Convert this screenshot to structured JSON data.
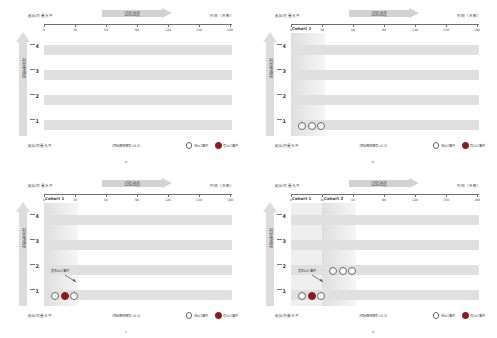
{
  "figure": {
    "panels": [
      {
        "letter": "a",
        "header_left": "起始剂量水平",
        "header_right": "时间（天数）",
        "progress_label": "试验进度",
        "dose_axis_label": "剂量递增",
        "footer_left": "起始剂量水平",
        "footer_center": "（目标毒性概率=0.3）",
        "legend": [
          {
            "marker": "open-circle",
            "label": "无DLT事件"
          },
          {
            "marker": "filled-circle",
            "label": "有DLT事件"
          }
        ],
        "x_ticks": [
          "0",
          "30",
          "60",
          "90",
          "120",
          "150",
          "180"
        ],
        "dose_levels": [
          "1",
          "2",
          "3",
          "4"
        ],
        "cohorts": [],
        "subjects": [],
        "annotation": null
      },
      {
        "letter": "b",
        "header_left": "起始剂量水平",
        "header_right": "时间（天数）",
        "progress_label": "试验进度",
        "dose_axis_label": "剂量递增",
        "footer_left": "起始剂量水平",
        "footer_center": "（目标毒性概率=0.3）",
        "legend": [
          {
            "marker": "open-circle",
            "label": "无DLT事件"
          },
          {
            "marker": "filled-circle",
            "label": "有DLT事件"
          }
        ],
        "x_ticks": [
          "0",
          "30",
          "60",
          "90",
          "120",
          "150",
          "180"
        ],
        "dose_levels": [
          "1",
          "2",
          "3",
          "4"
        ],
        "cohorts": [
          {
            "label": "Cohort 1",
            "start_day": 0,
            "end_day": 30
          }
        ],
        "subjects": [
          {
            "dose_level": 1,
            "day": 8,
            "dlt": false
          },
          {
            "dose_level": 1,
            "day": 15,
            "dlt": false
          },
          {
            "dose_level": 1,
            "day": 22,
            "dlt": false
          }
        ],
        "annotation": null
      },
      {
        "letter": "c",
        "header_left": "起始剂量水平",
        "header_right": "时间（天数）",
        "progress_label": "试验进度",
        "dose_axis_label": "剂量递增",
        "footer_left": "起始剂量水平",
        "footer_center": "（目标毒性概率=0.3）",
        "legend": [
          {
            "marker": "open-circle",
            "label": "无DLT事件"
          },
          {
            "marker": "filled-circle",
            "label": "有DLT事件"
          }
        ],
        "x_ticks": [
          "0",
          "30",
          "60",
          "90",
          "120",
          "150",
          "180"
        ],
        "dose_levels": [
          "1",
          "2",
          "3",
          "4"
        ],
        "cohorts": [
          {
            "label": "Cohort 1",
            "start_day": 0,
            "end_day": 30
          }
        ],
        "subjects": [
          {
            "dose_level": 1,
            "day": 8,
            "dlt": false
          },
          {
            "dose_level": 1,
            "day": 15,
            "dlt": true
          },
          {
            "dose_level": 1,
            "day": 22,
            "dlt": false
          }
        ],
        "annotation": {
          "text": "发生DLT事件",
          "target_dose_level": 1
        }
      },
      {
        "letter": "d",
        "header_left": "起始剂量水平",
        "header_right": "时间（天数）",
        "progress_label": "试验进度",
        "dose_axis_label": "剂量递增",
        "footer_left": "起始剂量水平",
        "footer_center": "（目标毒性概率=0.3）",
        "legend": [
          {
            "marker": "open-circle",
            "label": "无DLT事件"
          },
          {
            "marker": "filled-circle",
            "label": "有DLT事件"
          }
        ],
        "x_ticks": [
          "0",
          "30",
          "60",
          "90",
          "120",
          "150",
          "180"
        ],
        "dose_levels": [
          "1",
          "2",
          "3",
          "4"
        ],
        "cohorts": [
          {
            "label": "Cohort 1",
            "start_day": 0,
            "end_day": 30
          },
          {
            "label": "Cohort 2",
            "start_day": 30,
            "end_day": 60
          }
        ],
        "subjects": [
          {
            "dose_level": 1,
            "day": 8,
            "dlt": false
          },
          {
            "dose_level": 1,
            "day": 15,
            "dlt": true
          },
          {
            "dose_level": 1,
            "day": 22,
            "dlt": false
          },
          {
            "dose_level": 2,
            "day": 38,
            "dlt": false
          },
          {
            "dose_level": 2,
            "day": 45,
            "dlt": false
          },
          {
            "dose_level": 2,
            "day": 52,
            "dlt": false
          }
        ],
        "annotation": {
          "text": "发生DLT事件",
          "target_dose_level": 1
        }
      }
    ]
  }
}
